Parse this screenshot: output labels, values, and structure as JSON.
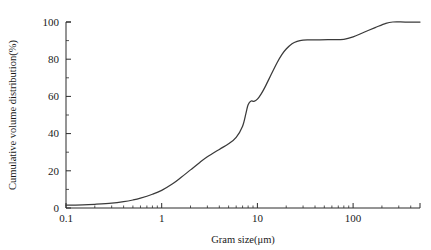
{
  "chart_data": {
    "type": "line",
    "title": "",
    "xlabel": "Gram size(μm)",
    "ylabel": "Cumulative volume distribution(%)",
    "xscale": "log",
    "yscale": "linear",
    "xlim": [
      0.1,
      500
    ],
    "ylim": [
      0,
      100
    ],
    "grid": false,
    "legend": null,
    "x_tick_labels": [
      "0.1",
      "1",
      "10",
      "100"
    ],
    "x_tick_values": [
      0.1,
      1,
      10,
      100
    ],
    "y_tick_labels": [
      "0",
      "20",
      "40",
      "60",
      "80",
      "100"
    ],
    "y_tick_values": [
      0,
      20,
      40,
      60,
      80,
      100
    ],
    "y_minor_tick_values": [
      10,
      30,
      50,
      70,
      90
    ],
    "series": [
      {
        "name": "Cumulative volume distribution",
        "color": "#3a3a3a",
        "x": [
          0.1,
          0.15,
          0.2,
          0.3,
          0.4,
          0.5,
          0.6,
          0.8,
          1.0,
          1.3,
          1.6,
          2.0,
          2.5,
          3.0,
          4.0,
          5.0,
          6.0,
          7.0,
          7.6,
          8.0,
          8.6,
          9.2,
          10.0,
          11.0,
          12.0,
          14.0,
          16.0,
          18.0,
          20.0,
          23.0,
          26.0,
          30.0,
          35.0,
          45.0,
          60.0,
          80.0,
          100.0,
          130.0,
          170.0,
          220.0,
          260.0,
          350.0,
          500.0
        ],
        "y": [
          1.5,
          1.7,
          2.0,
          2.6,
          3.4,
          4.3,
          5.3,
          7.4,
          9.5,
          13.0,
          16.5,
          20.5,
          24.5,
          27.5,
          31.5,
          34.5,
          38.0,
          44.0,
          51.0,
          55.5,
          57.5,
          57.3,
          58.5,
          61.5,
          65.0,
          72.0,
          78.0,
          82.5,
          85.5,
          88.3,
          89.6,
          90.3,
          90.4,
          90.4,
          90.5,
          90.7,
          92.0,
          94.5,
          97.0,
          99.3,
          100.0,
          100.0,
          100.0
        ]
      }
    ]
  },
  "axes": {
    "x_title": "Gram size(μm)",
    "y_title": "Cumulative volume distribution(%)"
  },
  "colors": {
    "curve": "#3a3a3a",
    "axis": "#2b2b2b",
    "background": "#ffffff"
  }
}
